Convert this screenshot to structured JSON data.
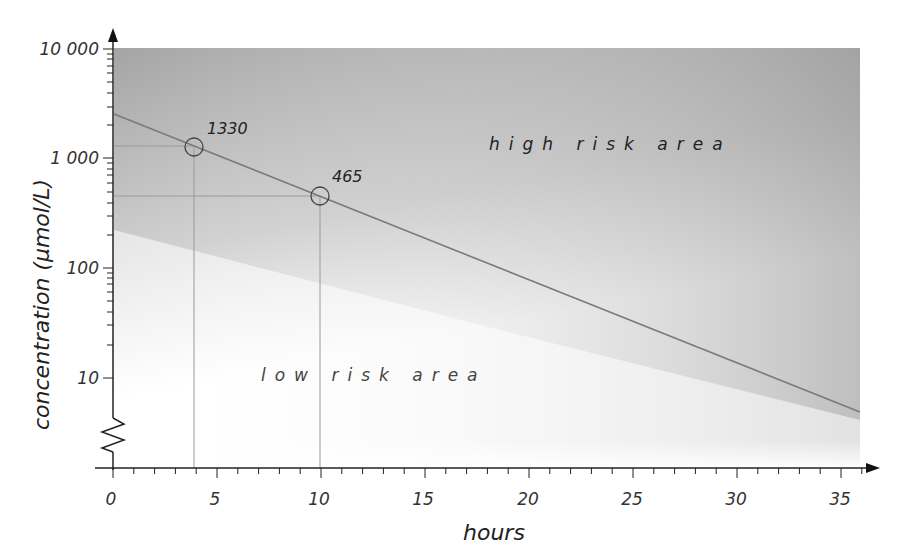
{
  "chart_data": {
    "type": "line",
    "title": "",
    "xlabel": "hours",
    "ylabel": "concentration (µmol/L)",
    "yscale": "log",
    "xlim": [
      0,
      36
    ],
    "ylim": [
      1,
      10000
    ],
    "x_ticks": [
      0,
      5,
      10,
      15,
      20,
      25,
      30,
      35
    ],
    "x_tick_labels": [
      "0",
      "5",
      "10",
      "15",
      "20",
      "25",
      "30",
      "35"
    ],
    "y_ticks": [
      10,
      100,
      1000,
      10000
    ],
    "y_tick_labels": [
      "10",
      "100",
      "1 000",
      "10 000"
    ],
    "series": [
      {
        "name": "threshold line",
        "x": [
          0,
          4,
          10,
          36
        ],
        "y": [
          2600,
          1330,
          465,
          5
        ]
      }
    ],
    "annotated_points": [
      {
        "x": 4,
        "y": 1330,
        "label": "1330"
      },
      {
        "x": 10,
        "y": 465,
        "label": "465"
      }
    ],
    "regions": [
      {
        "label": "high risk area",
        "position": "above line",
        "fill": "gray gradient"
      },
      {
        "label": "low risk area",
        "position": "below line",
        "fill": "white"
      }
    ],
    "axis_break": "y-axis break (zigzag) below 10",
    "grid": false,
    "legend": null
  },
  "labels": {
    "high_risk": "high risk area",
    "low_risk": "low risk area",
    "point1": "1330",
    "point2": "465",
    "x_title": "hours",
    "y_title": "concentration (µmol/L)",
    "x_ticks": [
      "0",
      "5",
      "10",
      "15",
      "20",
      "25",
      "30",
      "35"
    ],
    "y_ticks": [
      "10",
      "100",
      "1 000",
      "10 000"
    ]
  },
  "colors": {
    "axis": "#222222",
    "line": "#777777",
    "guide": "#999999",
    "shade_dark": "#8e8e8e",
    "shade_light": "#ffffff"
  }
}
